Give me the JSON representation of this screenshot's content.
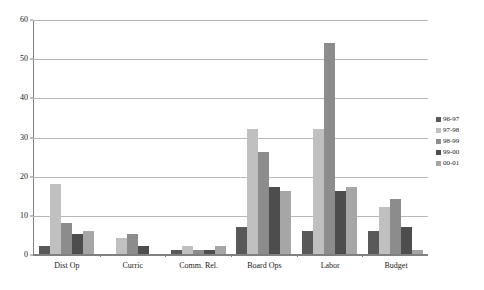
{
  "chart_data": {
    "type": "bar",
    "title": "",
    "subtitle": "",
    "xlabel": "",
    "ylabel": "",
    "ylim": [
      0,
      60
    ],
    "yticks": [
      0,
      10,
      20,
      30,
      40,
      50,
      60
    ],
    "ytick_labels": [
      "0",
      "10",
      "20",
      "30",
      "40",
      "50",
      "60"
    ],
    "grid": true,
    "grid_orientation": "horizontal",
    "legend_position": "right",
    "categories": [
      "Dist Op",
      "Curric",
      "Comm. Rel.",
      "Board Ops",
      "Labor",
      "Budget"
    ],
    "series": [
      {
        "name": "96-97",
        "color": "#595959",
        "values": [
          2,
          0,
          1,
          7,
          6,
          6
        ]
      },
      {
        "name": "97-98",
        "color": "#c0c0c0",
        "values": [
          18,
          4,
          2,
          32,
          32,
          12
        ]
      },
      {
        "name": "98-99",
        "color": "#8c8c8c",
        "values": [
          8,
          5,
          1,
          26,
          54,
          14
        ]
      },
      {
        "name": "99-00",
        "color": "#4d4d4d",
        "values": [
          5,
          2,
          1,
          17,
          16,
          7
        ]
      },
      {
        "name": "00-01",
        "color": "#a6a6a6",
        "values": [
          6,
          0,
          2,
          16,
          17,
          1
        ]
      }
    ]
  },
  "axis": {
    "y_tick_labels": [
      "60",
      "50",
      "40",
      "30",
      "20",
      "10",
      "0"
    ],
    "axis_color": "#808080",
    "grid_color": "#b8b8b8"
  },
  "legend": {
    "items": [
      {
        "label": "96-97",
        "color": "#595959"
      },
      {
        "label": "97-98",
        "color": "#c0c0c0"
      },
      {
        "label": "98-99",
        "color": "#8c8c8c"
      },
      {
        "label": "99-00",
        "color": "#4d4d4d"
      },
      {
        "label": "00-01",
        "color": "#a6a6a6"
      }
    ]
  }
}
